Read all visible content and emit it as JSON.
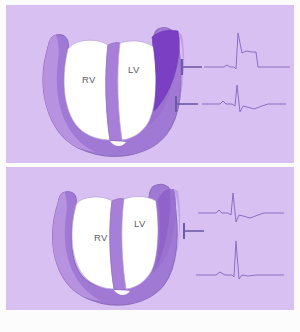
{
  "figure": {
    "background_color": "#d9c0f2",
    "page_color": "#fcfcfc",
    "caption": ""
  },
  "palette": {
    "background": "#d9c0f2",
    "myocardium_light": "#b18cdd",
    "myocardium_mid": "#a079d4",
    "myocardium_shadow": "#8f63c9",
    "infarct_dark": "#7b3fc4",
    "cavity": "#ffffff",
    "outline": "#8f6fc0",
    "trace": "#8b6fc4",
    "electrode": "#6f5aa8",
    "label_text": "#5c5c66"
  },
  "panels": [
    {
      "id": "panel-top",
      "name": "infarcted-heart-panel",
      "title": "Transmural infarct of left ventricular lateral wall",
      "has_infarct": true,
      "infarct_label": "infarct-wedge",
      "chambers": [
        {
          "id": "rv",
          "label": "RV",
          "name": "right-ventricle-cavity"
        },
        {
          "id": "lv",
          "label": "LV",
          "name": "left-ventricle-cavity"
        }
      ],
      "electrodes": [
        {
          "id": "top-electrode-1",
          "label": "",
          "y": 62
        },
        {
          "id": "top-electrode-2",
          "label": "",
          "y": 99
        }
      ],
      "traces": [
        {
          "id": "trace-injury",
          "name": "ecg-trace-st-elevation",
          "label": "",
          "description": "tall R wave with elevated ST plateau",
          "baseline_y": 62
        },
        {
          "id": "trace-reciprocal",
          "name": "ecg-trace-reciprocal",
          "label": "",
          "description": "QRS with negative ST depression",
          "baseline_y": 99
        }
      ]
    },
    {
      "id": "panel-bottom",
      "name": "normal-heart-panel",
      "title": "Normal myocardium",
      "has_infarct": false,
      "infarct_label": "",
      "chambers": [
        {
          "id": "rv",
          "label": "RV",
          "name": "right-ventricle-cavity"
        },
        {
          "id": "lv",
          "label": "LV",
          "name": "left-ventricle-cavity"
        }
      ],
      "electrodes": [
        {
          "id": "bottom-electrode-1",
          "label": "",
          "y": 47
        }
      ],
      "traces": [
        {
          "id": "trace-normal-1",
          "name": "ecg-trace-normal-upper",
          "label": "",
          "description": "normal QRS complex",
          "baseline_y": 36
        },
        {
          "id": "trace-normal-2",
          "name": "ecg-trace-normal-lower",
          "label": "",
          "description": "normal QRS complex, taller R wave",
          "baseline_y": 98
        }
      ]
    }
  ]
}
